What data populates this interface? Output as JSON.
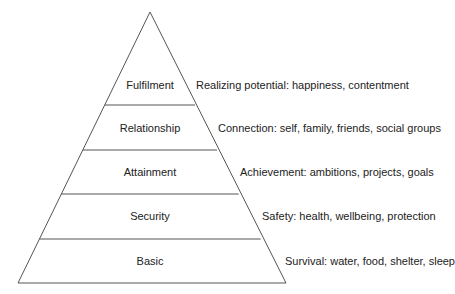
{
  "diagram": {
    "type": "pyramid",
    "line_color": "#555555",
    "text_color": "#222222",
    "geometry": {
      "apex": [
        150,
        12
      ],
      "base_left": [
        18,
        283
      ],
      "base_right": [
        286,
        283
      ],
      "dividers_y": [
        105,
        150,
        194,
        239
      ]
    },
    "levels": [
      {
        "name": "Fulfilment",
        "description": "Realizing potential: happiness, contentment",
        "label_y": 85,
        "desc_x": 189
      },
      {
        "name": "Relationship",
        "description": "Connection: self, family, friends, social groups",
        "label_y": 128,
        "desc_x": 218
      },
      {
        "name": "Attainment",
        "description": "Achievement: ambitions, projects, goals",
        "label_y": 172,
        "desc_x": 241
      },
      {
        "name": "Security",
        "description": "Safety: health, wellbeing, protection",
        "label_y": 216,
        "desc_x": 262
      },
      {
        "name": "Basic",
        "description": "Survival: water, food, shelter, sleep",
        "label_y": 261,
        "desc_x": 285
      }
    ]
  }
}
